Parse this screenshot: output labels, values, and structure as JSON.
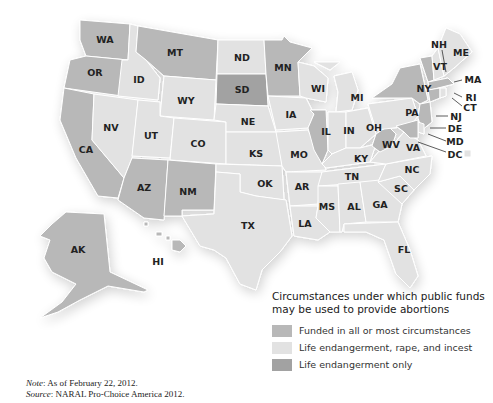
{
  "colors": {
    "all_most": "#b8b8b8",
    "life_rape_incest": "#e2e2e2",
    "life_only": "#a2a2a2",
    "border": "#ffffff",
    "label": "#222222"
  },
  "legend": {
    "title_line1": "Circumstances under which public funds",
    "title_line2": "may be used to provide abortions",
    "items": [
      {
        "label": "Funded in all or most circumstances",
        "category": "all_most"
      },
      {
        "label": "Life endangerment, rape, and incest",
        "category": "life_rape_incest"
      },
      {
        "label": "Life endangerment only",
        "category": "life_only"
      }
    ]
  },
  "footnote": {
    "note_label": "Note",
    "note_text": ": As of February 22, 2012.",
    "source_label": "Source",
    "source_text": ": NARAL Pro-Choice America 2012."
  },
  "states": {
    "WA": "all_most",
    "OR": "all_most",
    "CA": "all_most",
    "MT": "all_most",
    "AZ": "all_most",
    "NM": "all_most",
    "AK": "all_most",
    "HI": "all_most",
    "MN": "all_most",
    "IL": "all_most",
    "NY": "all_most",
    "VT": "all_most",
    "NJ": "all_most",
    "MD": "all_most",
    "CT": "all_most",
    "MA": "all_most",
    "WV": "all_most",
    "SD": "life_only",
    "ID": "life_rape_incest",
    "NV": "life_rape_incest",
    "UT": "life_rape_incest",
    "WY": "life_rape_incest",
    "CO": "life_rape_incest",
    "ND": "life_rape_incest",
    "NE": "life_rape_incest",
    "KS": "life_rape_incest",
    "OK": "life_rape_incest",
    "TX": "life_rape_incest",
    "IA": "life_rape_incest",
    "MO": "life_rape_incest",
    "AR": "life_rape_incest",
    "LA": "life_rape_incest",
    "WI": "life_rape_incest",
    "MI": "life_rape_incest",
    "IN": "life_rape_incest",
    "OH": "life_rape_incest",
    "KY": "life_rape_incest",
    "TN": "life_rape_incest",
    "MS": "life_rape_incest",
    "AL": "life_rape_incest",
    "GA": "life_rape_incest",
    "FL": "life_rape_incest",
    "SC": "life_rape_incest",
    "NC": "life_rape_incest",
    "VA": "life_rape_incest",
    "PA": "life_rape_incest",
    "DE": "life_rape_incest",
    "ME": "life_rape_incest",
    "NH": "life_rape_incest",
    "RI": "life_rape_incest",
    "DC": "life_rape_incest"
  },
  "labels": {
    "WA": "WA",
    "OR": "OR",
    "CA": "CA",
    "ID": "ID",
    "NV": "NV",
    "MT": "MT",
    "WY": "WY",
    "UT": "UT",
    "AZ": "AZ",
    "CO": "CO",
    "NM": "NM",
    "ND": "ND",
    "SD": "SD",
    "NE": "NE",
    "KS": "KS",
    "OK": "OK",
    "TX": "TX",
    "MN": "MN",
    "IA": "IA",
    "MO": "MO",
    "AR": "AR",
    "LA": "LA",
    "WI": "WI",
    "IL": "IL",
    "MI": "MI",
    "IN": "IN",
    "OH": "OH",
    "KY": "KY",
    "TN": "TN",
    "MS": "MS",
    "AL": "AL",
    "GA": "GA",
    "FL": "FL",
    "SC": "SC",
    "NC": "NC",
    "VA": "VA",
    "WV": "WV",
    "PA": "PA",
    "NY": "NY",
    "VT": "VT",
    "NH": "NH",
    "ME": "ME",
    "MA": "MA",
    "RI": "RI",
    "CT": "CT",
    "NJ": "NJ",
    "DE": "DE",
    "MD": "MD",
    "DC": "DC",
    "AK": "AK",
    "HI": "HI"
  }
}
